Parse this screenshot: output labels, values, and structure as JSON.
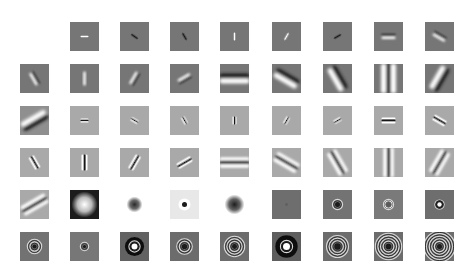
{
  "figure": {
    "title": "",
    "layout": {
      "col_x": [
        20,
        70,
        120,
        170,
        220,
        272,
        323,
        374,
        425
      ],
      "row_y": [
        22,
        64,
        106,
        148,
        190,
        232
      ],
      "cell_size": 29
    },
    "colors": {
      "dark_gray": "#757575",
      "light_gray": "#a9a9a9",
      "very_light": "#e6e6e6",
      "white": "#ffffff",
      "black": "#1a1a1a"
    },
    "rows": [
      {
        "cells": [
          null,
          {
            "type": "bar",
            "bg": "#767676",
            "angle": 0,
            "len": 8,
            "wid": 1.6,
            "pol": "light"
          },
          {
            "type": "bar",
            "bg": "#767676",
            "angle": 35,
            "len": 8,
            "wid": 1.6,
            "pol": "dark"
          },
          {
            "type": "bar",
            "bg": "#767676",
            "angle": 60,
            "len": 8,
            "wid": 1.6,
            "pol": "dark"
          },
          {
            "type": "bar",
            "bg": "#767676",
            "angle": 90,
            "len": 8,
            "wid": 1.6,
            "pol": "light"
          },
          {
            "type": "bar",
            "bg": "#767676",
            "angle": 120,
            "len": 8,
            "wid": 1.6,
            "pol": "light"
          },
          {
            "type": "bar",
            "bg": "#767676",
            "angle": 150,
            "len": 8,
            "wid": 1.6,
            "pol": "dark"
          },
          {
            "type": "bar",
            "bg": "#767676",
            "angle": 0,
            "len": 14,
            "wid": 2.5,
            "pol": "split"
          },
          {
            "type": "bar",
            "bg": "#767676",
            "angle": 30,
            "len": 14,
            "wid": 2.5,
            "pol": "split"
          }
        ]
      },
      {
        "cells": [
          {
            "type": "bar",
            "bg": "#767676",
            "angle": 60,
            "len": 14,
            "wid": 2.5,
            "pol": "split"
          },
          {
            "type": "bar",
            "bg": "#767676",
            "angle": 90,
            "len": 14,
            "wid": 2.5,
            "pol": "light"
          },
          {
            "type": "bar",
            "bg": "#767676",
            "angle": 120,
            "len": 14,
            "wid": 2.5,
            "pol": "split"
          },
          {
            "type": "bar",
            "bg": "#767676",
            "angle": 150,
            "len": 14,
            "wid": 2.5,
            "pol": "split"
          },
          {
            "type": "bar",
            "bg": "#767676",
            "angle": 0,
            "len": 30,
            "wid": 5,
            "pol": "split"
          },
          {
            "type": "bar",
            "bg": "#767676",
            "angle": 30,
            "len": 26,
            "wid": 5,
            "pol": "split"
          },
          {
            "type": "bar",
            "bg": "#767676",
            "angle": 60,
            "len": 26,
            "wid": 5,
            "pol": "split"
          },
          {
            "type": "bar",
            "bg": "#767676",
            "angle": 90,
            "len": 30,
            "wid": 5,
            "pol": "triple"
          },
          {
            "type": "bar",
            "bg": "#767676",
            "angle": 120,
            "len": 26,
            "wid": 5,
            "pol": "split"
          }
        ]
      },
      {
        "cells": [
          {
            "type": "bar",
            "bg": "#8f8f8f",
            "angle": 150,
            "len": 28,
            "wid": 5,
            "pol": "split"
          },
          {
            "type": "bar",
            "bg": "#a9a9a9",
            "angle": 0,
            "len": 8,
            "wid": 1.4,
            "pol": "triple"
          },
          {
            "type": "bar",
            "bg": "#a9a9a9",
            "angle": 30,
            "len": 8,
            "wid": 1.4,
            "pol": "triple"
          },
          {
            "type": "bar",
            "bg": "#a9a9a9",
            "angle": 60,
            "len": 8,
            "wid": 1.4,
            "pol": "triple"
          },
          {
            "type": "bar",
            "bg": "#a9a9a9",
            "angle": 90,
            "len": 8,
            "wid": 1.4,
            "pol": "triple"
          },
          {
            "type": "bar",
            "bg": "#a9a9a9",
            "angle": 120,
            "len": 8,
            "wid": 1.4,
            "pol": "triple"
          },
          {
            "type": "bar",
            "bg": "#a9a9a9",
            "angle": 150,
            "len": 8,
            "wid": 1.4,
            "pol": "triple"
          },
          {
            "type": "bar",
            "bg": "#a9a9a9",
            "angle": 0,
            "len": 14,
            "wid": 2,
            "pol": "triple"
          },
          {
            "type": "bar",
            "bg": "#a9a9a9",
            "angle": 30,
            "len": 14,
            "wid": 2,
            "pol": "triple"
          }
        ]
      },
      {
        "cells": [
          {
            "type": "bar",
            "bg": "#a9a9a9",
            "angle": 60,
            "len": 14,
            "wid": 2,
            "pol": "triple"
          },
          {
            "type": "bar",
            "bg": "#a9a9a9",
            "angle": 90,
            "len": 16,
            "wid": 2,
            "pol": "triple"
          },
          {
            "type": "bar",
            "bg": "#a9a9a9",
            "angle": 120,
            "len": 16,
            "wid": 2,
            "pol": "triple"
          },
          {
            "type": "bar",
            "bg": "#a9a9a9",
            "angle": 150,
            "len": 16,
            "wid": 2,
            "pol": "triple"
          },
          {
            "type": "bar",
            "bg": "#a9a9a9",
            "angle": 0,
            "len": 30,
            "wid": 3.5,
            "pol": "triple"
          },
          {
            "type": "bar",
            "bg": "#a9a9a9",
            "angle": 30,
            "len": 26,
            "wid": 3.5,
            "pol": "triple"
          },
          {
            "type": "bar",
            "bg": "#a9a9a9",
            "angle": 60,
            "len": 26,
            "wid": 3.5,
            "pol": "triple"
          },
          {
            "type": "bar",
            "bg": "#a9a9a9",
            "angle": 90,
            "len": 30,
            "wid": 3.5,
            "pol": "triple"
          },
          {
            "type": "bar",
            "bg": "#a9a9a9",
            "angle": 120,
            "len": 26,
            "wid": 3.5,
            "pol": "triple"
          }
        ]
      },
      {
        "cells": [
          {
            "type": "bar",
            "bg": "#a9a9a9",
            "angle": 150,
            "len": 28,
            "wid": 3.5,
            "pol": "triple"
          },
          {
            "type": "blob",
            "bg": "#1c1c1c",
            "fg": "#ffffff",
            "r": 13
          },
          {
            "type": "blob",
            "bg": "#ffffff",
            "fg": "#2a2a2a",
            "r": 8
          },
          {
            "type": "dot",
            "bg": "#e8e8e8",
            "ring": "#ffffff",
            "fg": "#1a1a1a",
            "r": 2.5
          },
          {
            "type": "blob",
            "bg": "#ffffff",
            "fg": "#1e1e1e",
            "r": 10
          },
          {
            "type": "rings",
            "bg": "#6e6e6e",
            "n": 0,
            "core": "#606060",
            "r": 1.5
          },
          {
            "type": "rings",
            "bg": "#737373",
            "n": 1,
            "core": "#1a1a1a",
            "r": 2.5
          },
          {
            "type": "rings",
            "bg": "#7a7a7a",
            "n": 1,
            "core": "#5a5a5a",
            "r": 2.5,
            "light": true
          },
          {
            "type": "rings",
            "bg": "#6e6e6e",
            "n": 1,
            "core": "#ffffff",
            "r": 2.2,
            "halo": "#111111"
          }
        ]
      },
      {
        "cells": [
          {
            "type": "rings",
            "bg": "#727272",
            "n": 2,
            "core": "#1a1a1a",
            "r": 2
          },
          {
            "type": "rings",
            "bg": "#777777",
            "n": 1,
            "core": "#1a1a1a",
            "r": 1.6
          },
          {
            "type": "rings",
            "bg": "#626262",
            "n": 1,
            "core": "#ffffff",
            "r": 3,
            "halo": "#111111",
            "big": true
          },
          {
            "type": "rings",
            "bg": "#6c6c6c",
            "n": 2,
            "core": "#1a1a1a",
            "r": 2.6
          },
          {
            "type": "rings",
            "bg": "#6c6c6c",
            "n": 3,
            "core": "#1a1a1a",
            "r": 2.4
          },
          {
            "type": "rings",
            "bg": "#5e5e5e",
            "n": 1,
            "core": "#ffffff",
            "r": 3.5,
            "halo": "#0e0e0e",
            "big": true
          },
          {
            "type": "rings",
            "bg": "#6c6c6c",
            "n": 3,
            "core": "#1a1a1a",
            "r": 3.2
          },
          {
            "type": "rings",
            "bg": "#6c6c6c",
            "n": 4,
            "core": "#1a1a1a",
            "r": 2.8
          },
          {
            "type": "rings",
            "bg": "#6e6e6e",
            "n": 5,
            "core": "#1a1a1a",
            "r": 2.5
          }
        ]
      }
    ]
  }
}
